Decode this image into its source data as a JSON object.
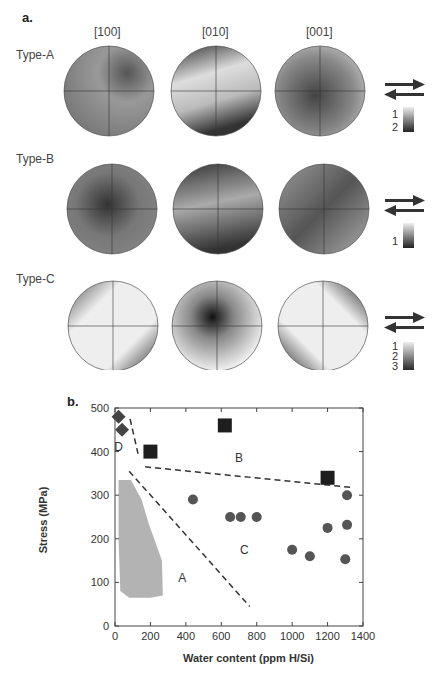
{
  "panel_a": {
    "label": "a.",
    "columns": [
      "[100]",
      "[010]",
      "[001]"
    ],
    "rows": [
      {
        "label": "Type-A",
        "scale_labels": [
          "1",
          "2"
        ]
      },
      {
        "label": "Type-B",
        "scale_labels": [
          "1"
        ]
      },
      {
        "label": "Type-C",
        "scale_labels": [
          "1",
          "2",
          "3"
        ]
      }
    ],
    "shear_icon": "shear-sense-arrows-icon"
  },
  "panel_b": {
    "label": "b."
  },
  "chart_data": {
    "type": "scatter",
    "title": "",
    "xlabel": "Water content (ppm H/Si)",
    "ylabel": "Stress (MPa)",
    "xlim": [
      0,
      1400
    ],
    "ylim": [
      0,
      500
    ],
    "xticks": [
      "0",
      "200",
      "400",
      "600",
      "800",
      "1000",
      "1200",
      "1400"
    ],
    "yticks": [
      "0",
      "100",
      "200",
      "300",
      "400",
      "500"
    ],
    "grid": false,
    "series": [
      {
        "name": "Type-D",
        "marker": "diamond",
        "color": "#444444",
        "points": [
          [
            20,
            480
          ],
          [
            40,
            450
          ]
        ]
      },
      {
        "name": "Type-B",
        "marker": "square",
        "color": "#1e1e1e",
        "points": [
          [
            200,
            400
          ],
          [
            620,
            460
          ],
          [
            1200,
            340
          ]
        ]
      },
      {
        "name": "Type-C",
        "marker": "circle",
        "color": "#555555",
        "points": [
          [
            440,
            290
          ],
          [
            650,
            250
          ],
          [
            710,
            250
          ],
          [
            800,
            250
          ],
          [
            1000,
            175
          ],
          [
            1100,
            160
          ],
          [
            1200,
            225
          ],
          [
            1310,
            300
          ],
          [
            1310,
            232
          ],
          [
            1300,
            153
          ]
        ]
      }
    ],
    "boundaries": [
      {
        "style": "dashed",
        "points": [
          [
            85,
            475
          ],
          [
            130,
            395
          ]
        ]
      },
      {
        "style": "dashed",
        "points": [
          [
            170,
            365
          ],
          [
            1330,
            318
          ]
        ]
      },
      {
        "style": "dashed",
        "points": [
          [
            80,
            355
          ],
          [
            760,
            45
          ]
        ]
      }
    ],
    "regions": [
      {
        "label": "A",
        "x": 380,
        "y": 110
      },
      {
        "label": "B",
        "x": 700,
        "y": 385
      },
      {
        "label": "C",
        "x": 730,
        "y": 175
      },
      {
        "label": "D",
        "x": 20,
        "y": 410
      }
    ],
    "shaded_region": {
      "label": "Type-A field",
      "color": "#b3b3b3",
      "points": [
        [
          20,
          335
        ],
        [
          90,
          335
        ],
        [
          150,
          290
        ],
        [
          190,
          235
        ],
        [
          265,
          150
        ],
        [
          270,
          70
        ],
        [
          200,
          65
        ],
        [
          80,
          65
        ],
        [
          30,
          80
        ],
        [
          20,
          200
        ]
      ]
    }
  }
}
